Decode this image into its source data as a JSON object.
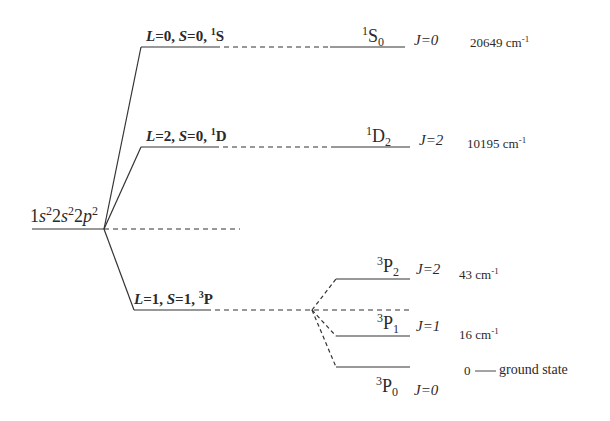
{
  "diagram": {
    "type": "term-splitting energy level diagram",
    "configuration": {
      "label": "1s²2s²2p²",
      "parts": [
        "1",
        "s",
        "2",
        "2",
        "s",
        "2",
        "2",
        "p",
        "2"
      ]
    },
    "terms": [
      {
        "id": "1S",
        "L": "0",
        "S": "0",
        "symbol_sup": "1",
        "symbol": "S",
        "label": "L=0, S=0, ¹S"
      },
      {
        "id": "1D",
        "L": "2",
        "S": "0",
        "symbol_sup": "1",
        "symbol": "D",
        "label": "L=2, S=0, ¹D"
      },
      {
        "id": "3P",
        "L": "1",
        "S": "1",
        "symbol_sup": "3",
        "symbol": "P",
        "label": "L=1, S=1, ³P"
      }
    ],
    "levels": [
      {
        "id": "1S0",
        "sup": "1",
        "letter": "S",
        "sub": "0",
        "J": "J=0",
        "energy": "20649",
        "unit": "cm",
        "unit_exp": "-1"
      },
      {
        "id": "1D2",
        "sup": "1",
        "letter": "D",
        "sub": "2",
        "J": "J=2",
        "energy": "10195",
        "unit": "cm",
        "unit_exp": "-1"
      },
      {
        "id": "3P2",
        "sup": "3",
        "letter": "P",
        "sub": "2",
        "J": "J=2",
        "energy": "43",
        "unit": "cm",
        "unit_exp": "-1"
      },
      {
        "id": "3P1",
        "sup": "3",
        "letter": "P",
        "sub": "1",
        "J": "J=1",
        "energy": "16",
        "unit": "cm",
        "unit_exp": "-1"
      },
      {
        "id": "3P0",
        "sup": "3",
        "letter": "P",
        "sub": "0",
        "J": "J=0",
        "energy": "0",
        "note": "ground state"
      }
    ],
    "eq": "=",
    "comma": ",",
    "L": "L",
    "S": "S",
    "dash": "——"
  },
  "colors": {
    "line": "#333333",
    "text": "#2a2a2a",
    "background": "#ffffff"
  }
}
